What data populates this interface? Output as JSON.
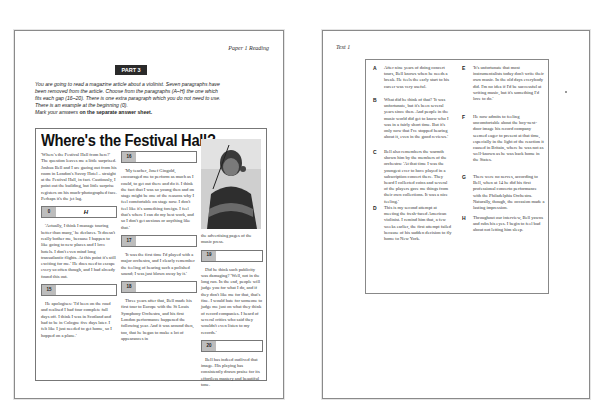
{
  "left_page": {
    "running_head": "Paper 1 Reading",
    "part_label": "PART 3",
    "instructions": {
      "line1": "You are going to read a magazine article about a violinist. Seven paragraphs have",
      "line2": "been removed from the article. Choose from the paragraphs (A–H) the one which",
      "line3": "fits each gap (16–20). There is one extra paragraph which you do not need to use.",
      "line4": "There is an example at the beginning (0).",
      "line5_prefix": "Mark your answers ",
      "line5_bold": "on the separate answer sheet."
    },
    "article": {
      "headline": "Where's the Festival Hall?",
      "col1": {
        "p1": "'Where's the Festival Hall from here?' The question leaves me a little surprised. Joshua Bell and I are gazing out from his room in London's Savoy Hotel – straight at the Festival Hall, in fact. Cautiously, I point out the building, but little surprise registers on his much-photographed face. Perhaps it's the jet lag.",
        "gap0_num": "0",
        "gap0_answer": "H",
        "p2": "'Actually, I think I manage touring better than many,' he declares. 'It doesn't really bother me, because I happen to like going to new places and I love hotels. I don't even mind long transatlantic flights. At this point it's still exciting for me.' He does need to escape every so often though, and I had already found this out.",
        "gap15_num": "15",
        "p3": "He apologises: 'I'd been on the road and realised I had four complete full days off. I think I was in Scotland and had to be in Cologne five days later. I felt like I just needed to get home, so I hopped on a plane.'"
      },
      "col2": {
        "gap16_num": "16",
        "p1": "'My teacher, Josef Gingold, encouraged me to perform as much as I could, to get out there and do it. I think the fact that I was so young then and on stage might be one of the reasons why I feel comfortable on stage now. I don't feel like it's something foreign. I feel that's where I can do my best work, and so I don't get anxious or anything like that.'",
        "gap17_num": "17",
        "p2": "'It was the first time I'd played with a major orchestra, and I clearly remember the feeling of hearing such a polished sound; I was just blown away by it.'",
        "gap18_num": "18",
        "p3": "Three years after that, Bell made his first tour to Europe with the St Louis Symphony Orchestra, and his first London performance happened the following year. And it was around then, too, that he began to make a lot of appearances in"
      },
      "col3": {
        "p1": "the advertising pages of the music press.",
        "gap19_num": "19",
        "p2": "Did he think such publicity was damaging? 'Well, not in the long run. In the end, people will judge you for what I do, and if they don't like me for that, that's fine. I would hate for someone to judge me just on what they think of record companies. I heard of several critics who said they wouldn't even listen to my records.'",
        "gap20_num": "20",
        "p3": "Bell has indeed outlived that image. His playing has consistently drawn praise for its effortless mastery and beautiful tone."
      }
    }
  },
  "right_page": {
    "running_head": "Text 1",
    "options": [
      {
        "letter": "A",
        "text": "After nine years of doing concert tours, Bell knows when he needs a break. He feels the early start to his career was very useful."
      },
      {
        "letter": "B",
        "text": "What did he think of that? 'It was unfortunate, but it's been several years since then. And people in the music world did get to know who I was in a fairly short time. But it's only now that I've stopped hearing about it, even in the good reviews.'"
      },
      {
        "letter": "C",
        "text": "Bell also remembers the warmth shown him by the members of the orchestra: 'At that time I was the youngest ever to have played in a subscription concert there. They heard I collected coins and several of the players gave me things from their own collections. It was a nice feeling.'"
      },
      {
        "letter": "D",
        "text": "This is my second attempt at meeting the fresh-faced American violinist. I remind him that, a few weeks earlier, the first attempt failed because of his sudden decision to fly home to New York."
      },
      {
        "letter": "E",
        "text": "'It's unfortunate that most instrumentalists today don't write their own music. In the old days everybody did. I'm no idea if I'd be successful at writing music, but it's something I'd love to do.'"
      },
      {
        "letter": "F",
        "text": "He now admits to feeling uncomfortable about the boy-next-door image his record company seemed eager to present at that time, especially in the light of the reaction it caused in Britain, where he was not as well-known as he was back home in the States."
      },
      {
        "letter": "G",
        "text": "There were no nerves, according to Bell, when at 14 he did his first professional concerto performance with the Philadelphia Orchestra. Naturally, though, the occasion made a lasting impression."
      },
      {
        "letter": "H",
        "text": "Throughout our interview, Bell yawns and rubs his eyes. I begin to feel bad about not letting him sleep."
      }
    ]
  }
}
